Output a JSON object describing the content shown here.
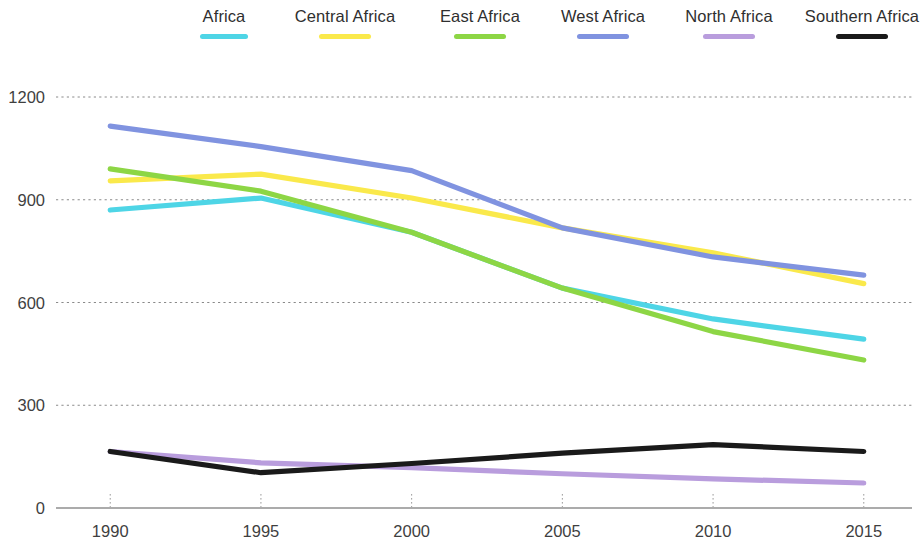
{
  "chart_data": {
    "type": "line",
    "title": "",
    "subtitle": "",
    "xlabel": "",
    "ylabel": "",
    "x": [
      1990,
      1995,
      2000,
      2005,
      2010,
      2015
    ],
    "categories": [
      "1990",
      "1995",
      "2000",
      "2005",
      "2010",
      "2015"
    ],
    "xtick_labels": [
      "1990",
      "1995",
      "2000",
      "2005",
      "2010",
      "2015"
    ],
    "ytick_labels": [
      "0",
      "300",
      "600",
      "900",
      "1200"
    ],
    "yticks": [
      0,
      300,
      600,
      900,
      1200
    ],
    "ylim": [
      0,
      1260
    ],
    "xlim": [
      1988.4,
      2016.6
    ],
    "grid": "horizontal-dashed",
    "legend_position": "top",
    "series": [
      {
        "name": "Africa",
        "color": "#4ED5E6",
        "values": [
          870,
          905,
          805,
          642,
          552,
          493
        ]
      },
      {
        "name": "Central Africa",
        "color": "#FAE94B",
        "values": [
          955,
          975,
          905,
          818,
          745,
          655
        ]
      },
      {
        "name": "East Africa",
        "color": "#8DD645",
        "values": [
          990,
          925,
          805,
          642,
          515,
          432
        ]
      },
      {
        "name": "West Africa",
        "color": "#8093E0",
        "values": [
          1115,
          1055,
          985,
          818,
          733,
          680
        ]
      },
      {
        "name": "North Africa",
        "color": "#B99DDD",
        "values": [
          165,
          132,
          118,
          100,
          85,
          73
        ]
      },
      {
        "name": "Southern Africa",
        "color": "#1A1A1A",
        "values": [
          165,
          103,
          130,
          160,
          185,
          165
        ]
      }
    ]
  },
  "legend": {
    "items": [
      {
        "label": "Africa",
        "color": "#4ED5E6"
      },
      {
        "label": "Central Africa",
        "color": "#FAE94B"
      },
      {
        "label": "East Africa",
        "color": "#8DD645"
      },
      {
        "label": "West Africa",
        "color": "#8093E0"
      },
      {
        "label": "North Africa",
        "color": "#B99DDD"
      },
      {
        "label": "Southern Africa",
        "color": "#1A1A1A"
      }
    ]
  },
  "axes": {
    "y_ticks": [
      "1200",
      "900",
      "600",
      "300",
      "0"
    ],
    "x_ticks": [
      "1990",
      "1995",
      "2000",
      "2005",
      "2010",
      "2015"
    ]
  },
  "colors": {
    "africa": "#4ED5E6",
    "central_africa": "#FAE94B",
    "east_africa": "#8DD645",
    "west_africa": "#8093E0",
    "north_africa": "#B99DDD",
    "southern_africa": "#1A1A1A",
    "grid": "#8a8a8a",
    "axis": "#8f8f8f",
    "text": "#3a3a3a",
    "background": "#ffffff"
  }
}
